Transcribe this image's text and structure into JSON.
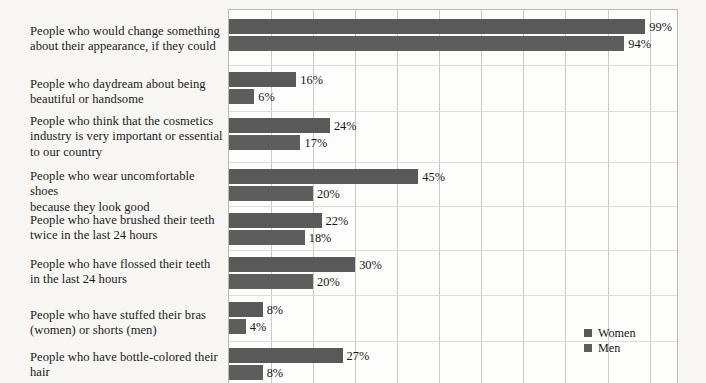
{
  "chart_data": {
    "type": "bar",
    "orientation": "horizontal",
    "title": "",
    "xlabel": "",
    "ylabel": "",
    "xlim": [
      0,
      107
    ],
    "grid": true,
    "gridline_step": 10,
    "value_suffix": "%",
    "legend_position": "bottom-right",
    "colors": {
      "women": "#595959",
      "men": "#5d5d5d",
      "background": "#f7f6f3",
      "plot_background": "#fdfdfc",
      "gridline": "#c9c9c9",
      "text": "#1a1a1a"
    },
    "categories": [
      "People who would change something about their appearance, if they could",
      "People who daydream about being beautiful or handsome",
      "People who think that the cosmetics industry is very important or essential to our country",
      "People who wear uncomfortable shoes because they look good",
      "People who have brushed their teeth twice in the last 24 hours",
      "People who have flossed their teeth in the last 24 hours",
      "People who have stuffed their bras (women) or shorts (men)",
      "People who have bottle-colored their hair"
    ],
    "series": [
      {
        "name": "Women",
        "values": [
          99,
          16,
          24,
          45,
          22,
          30,
          8,
          27
        ]
      },
      {
        "name": "Men",
        "values": [
          94,
          6,
          17,
          20,
          18,
          20,
          4,
          8
        ]
      }
    ],
    "value_labels": {
      "women": [
        "99%",
        "16%",
        "24%",
        "45%",
        "22%",
        "30%",
        "8%",
        "27%"
      ],
      "men": [
        "94%",
        "6%",
        "17%",
        "20%",
        "18%",
        "20%",
        "4%",
        "8%"
      ]
    }
  },
  "labels": [
    {
      "lines": [
        "People who would change something",
        "about their appearance, if they could"
      ]
    },
    {
      "lines": [
        "People who daydream about being",
        "beautiful or handsome"
      ]
    },
    {
      "lines": [
        "People who think that the cosmetics",
        "industry is very important or essential",
        "to our country"
      ]
    },
    {
      "lines": [
        "People who wear uncomfortable shoes",
        "because they look good"
      ]
    },
    {
      "lines": [
        "People who have brushed their teeth",
        "twice in the last 24 hours"
      ]
    },
    {
      "lines": [
        "People who have flossed their teeth",
        "in the last 24 hours"
      ]
    },
    {
      "lines": [
        "People who have stuffed their bras",
        "(women) or shorts (men)"
      ]
    },
    {
      "lines": [
        "People who have bottle-colored their",
        "hair"
      ]
    }
  ],
  "legend": {
    "items": [
      {
        "label": "Women",
        "color": "#595959"
      },
      {
        "label": "Men",
        "color": "#5d5d5d"
      }
    ]
  }
}
